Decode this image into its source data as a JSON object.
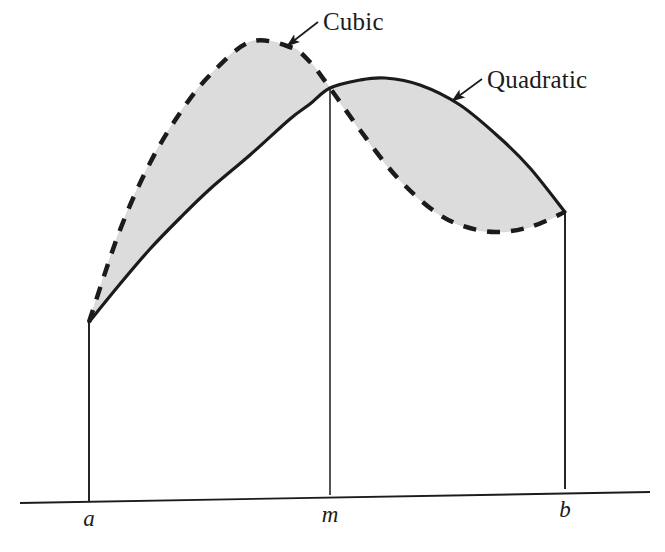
{
  "figure": {
    "background_color": "#ffffff",
    "ink_color": "#1b1b1b",
    "shade_color": "#dcdcdc",
    "shade_stroke_color": "#c9c9c9"
  },
  "labels": {
    "cubic": "Cubic",
    "quadratic": "Quadratic"
  },
  "axis": {
    "tick_a": "a",
    "tick_m": "m",
    "tick_b": "b"
  },
  "chart_data": {
    "type": "line",
    "title": "",
    "subtitle": "",
    "xlabel": "",
    "ylabel": "",
    "xlim": [
      89,
      565
    ],
    "ylim": [
      42,
      503
    ],
    "grid": false,
    "legend_position": "inline-annotations",
    "annotations": [
      {
        "text": "Cubic",
        "text_x": 323,
        "text_y": 30,
        "arrow_from_x": 318,
        "arrow_from_y": 22,
        "arrow_to_x": 287,
        "arrow_to_y": 46,
        "points_to_series": "Cubic"
      },
      {
        "text": "Quadratic",
        "text_x": 487,
        "text_y": 88,
        "arrow_from_x": 482,
        "arrow_from_y": 79,
        "arrow_to_x": 452,
        "arrow_to_y": 101,
        "points_to_series": "Quadratic"
      }
    ],
    "x_ticks": [
      {
        "label": "a",
        "x": 89
      },
      {
        "label": "m",
        "x": 330
      },
      {
        "label": "b",
        "x": 565
      }
    ],
    "axis_line": {
      "x1": 20,
      "y1": 503,
      "x2": 650,
      "y2": 492
    },
    "vertical_drop_lines": [
      {
        "label": "a",
        "x": 89,
        "y_top": 322,
        "y_bottom": 501
      },
      {
        "label": "m",
        "x": 330,
        "y_top": 88,
        "y_bottom": 495
      },
      {
        "label": "b",
        "x": 565,
        "y_top": 212,
        "y_bottom": 489
      }
    ],
    "series": [
      {
        "name": "Cubic",
        "style": "dashed",
        "stroke_width": 4.5,
        "dash_pattern": "13 11",
        "x": [
          89,
          120,
          150,
          180,
          210,
          250,
          290,
          310,
          330,
          360,
          395,
          430,
          460,
          495,
          530,
          565
        ],
        "y": [
          322,
          230,
          163,
          113,
          75,
          42,
          47,
          62,
          88,
          130,
          175,
          208,
          225,
          232,
          227,
          212
        ]
      },
      {
        "name": "Quadratic",
        "style": "solid",
        "stroke_width": 3.2,
        "dash_pattern": "none",
        "x": [
          89,
          120,
          150,
          180,
          210,
          250,
          290,
          310,
          330,
          360,
          385,
          420,
          460,
          500,
          530,
          565
        ],
        "y": [
          322,
          284,
          249,
          218,
          189,
          155,
          119,
          104,
          88,
          80,
          78,
          85,
          105,
          138,
          168,
          212
        ]
      }
    ],
    "shaded_regions": [
      {
        "name": "left-lobe",
        "between": [
          "Cubic",
          "Quadratic"
        ],
        "x_range": [
          89,
          330
        ],
        "upper_series": "Cubic",
        "lower_series": "Quadratic"
      },
      {
        "name": "right-lobe",
        "between": [
          "Quadratic",
          "Cubic"
        ],
        "x_range": [
          330,
          565
        ],
        "upper_series": "Quadratic",
        "lower_series": "Cubic"
      }
    ]
  }
}
